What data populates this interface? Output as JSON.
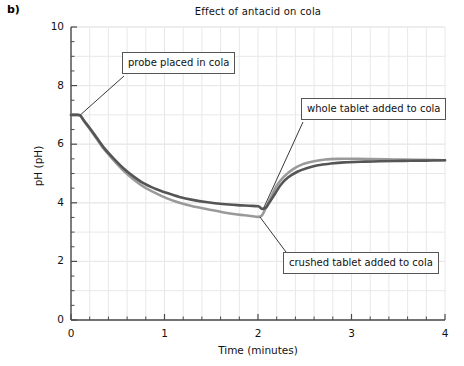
{
  "panel": {
    "letter": "b)"
  },
  "chart_data": {
    "type": "line",
    "title": "Effect of antacid on cola",
    "xlabel": "Time (minutes)",
    "ylabel": "pH (pH)",
    "xlim": [
      0,
      4
    ],
    "ylim": [
      0,
      10
    ],
    "xticks": [
      0,
      1,
      2,
      3,
      4
    ],
    "xtick_labels": [
      "0",
      "1",
      "2",
      "3",
      "4"
    ],
    "yticks": [
      0,
      2,
      4,
      6,
      8,
      10
    ],
    "ytick_labels": [
      "0",
      "2",
      "4",
      "6",
      "8",
      "10"
    ],
    "x_minor_tick_step": 0.2,
    "y_minor_tick_step": 0.5,
    "grid": true,
    "legend": "none",
    "series": [
      {
        "name": "whole tablet added to cola",
        "color": "#555555",
        "x": [
          0.0,
          0.06,
          0.1,
          0.14,
          0.2,
          0.28,
          0.36,
          0.46,
          0.56,
          0.66,
          0.78,
          0.9,
          1.02,
          1.16,
          1.3,
          1.46,
          1.62,
          1.78,
          1.9,
          2.0,
          2.04,
          2.08,
          2.12,
          2.18,
          2.24,
          2.32,
          2.42,
          2.52,
          2.64,
          2.78,
          2.92,
          3.1,
          3.3,
          3.55,
          3.8,
          4.0
        ],
        "y": [
          7.0,
          7.0,
          6.98,
          6.8,
          6.55,
          6.2,
          5.85,
          5.5,
          5.18,
          4.92,
          4.66,
          4.48,
          4.34,
          4.2,
          4.1,
          4.02,
          3.96,
          3.92,
          3.9,
          3.88,
          3.8,
          3.82,
          4.0,
          4.3,
          4.6,
          4.86,
          5.06,
          5.18,
          5.28,
          5.34,
          5.38,
          5.4,
          5.42,
          5.43,
          5.44,
          5.45
        ]
      },
      {
        "name": "crushed tablet added to cola",
        "color": "#9a9a9a",
        "x": [
          0.0,
          0.06,
          0.1,
          0.14,
          0.2,
          0.28,
          0.36,
          0.46,
          0.56,
          0.66,
          0.78,
          0.9,
          1.02,
          1.16,
          1.3,
          1.46,
          1.62,
          1.78,
          1.9,
          2.0,
          2.04,
          2.08,
          2.14,
          2.2,
          2.28,
          2.38,
          2.48,
          2.6,
          2.72,
          2.86,
          3.02,
          3.2,
          3.45,
          3.7,
          3.9,
          4.0
        ],
        "y": [
          7.0,
          7.0,
          6.97,
          6.78,
          6.52,
          6.16,
          5.8,
          5.44,
          5.1,
          4.82,
          4.54,
          4.34,
          4.16,
          4.0,
          3.88,
          3.78,
          3.68,
          3.6,
          3.56,
          3.52,
          3.56,
          3.8,
          4.2,
          4.58,
          4.9,
          5.16,
          5.32,
          5.42,
          5.48,
          5.5,
          5.5,
          5.49,
          5.48,
          5.47,
          5.46,
          5.45
        ]
      }
    ],
    "annotations": [
      {
        "id": "probe",
        "text": "probe placed in cola",
        "point_x": 0.1,
        "point_y": 7.0
      },
      {
        "id": "whole",
        "text": "whole tablet added to cola",
        "point_x": 2.06,
        "point_y": 3.82
      },
      {
        "id": "crushed",
        "text": "crushed tablet added to cola",
        "point_x": 2.02,
        "point_y": 3.52
      }
    ]
  },
  "colors": {
    "axis": "#4a4a4a",
    "grid": "#e8e8e8",
    "text": "#111111",
    "series_dark": "#555555",
    "series_light": "#9a9a9a",
    "callout_border": "#555555"
  }
}
